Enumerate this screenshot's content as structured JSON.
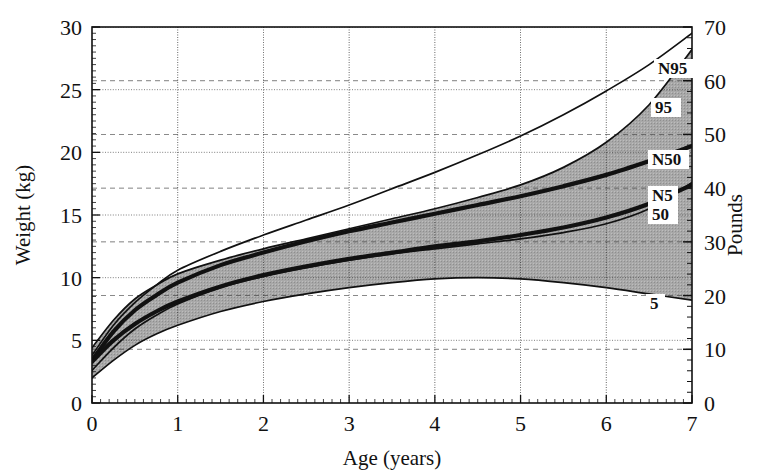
{
  "chart_data": {
    "type": "line",
    "title": "",
    "xlabel": "Age (years)",
    "ylabel": "Weight (kg)",
    "y2label": "Pounds",
    "xlim": [
      0,
      7
    ],
    "ylim": [
      0,
      30
    ],
    "y2lim": [
      0,
      70
    ],
    "xticks": [
      "0",
      "1",
      "2",
      "3",
      "4",
      "5",
      "6",
      "7"
    ],
    "yticks": [
      "0",
      "5",
      "10",
      "15",
      "20",
      "25",
      "30"
    ],
    "y2ticks": [
      "0",
      "10",
      "20",
      "30",
      "40",
      "50",
      "60",
      "70"
    ],
    "grid": true,
    "legend_position": "inline-right-end-labels",
    "shaded_band": {
      "label": "reference band between 5th and 95th percentile",
      "fill": "#a8a8a8"
    },
    "x": [
      0,
      0.25,
      0.5,
      0.75,
      1,
      1.5,
      2,
      2.5,
      3,
      3.5,
      4,
      4.5,
      5,
      5.5,
      6,
      6.5,
      7
    ],
    "series": [
      {
        "name": "N95",
        "label": "N95",
        "style": "thin",
        "values": [
          3.8,
          6.2,
          8.0,
          9.4,
          10.6,
          12.1,
          13.4,
          14.6,
          15.8,
          17.1,
          18.4,
          19.8,
          21.3,
          23.0,
          24.9,
          27.0,
          29.5
        ]
      },
      {
        "name": "95",
        "label": "95",
        "style": "thin",
        "values": [
          4.4,
          6.6,
          8.3,
          9.4,
          10.3,
          11.4,
          12.3,
          13.1,
          13.9,
          14.7,
          15.5,
          16.4,
          17.4,
          18.8,
          20.8,
          23.8,
          28.2
        ]
      },
      {
        "name": "N50",
        "label": "N50",
        "style": "bold",
        "values": [
          3.4,
          5.7,
          7.4,
          8.6,
          9.6,
          11.0,
          12.0,
          12.9,
          13.7,
          14.4,
          15.1,
          15.8,
          16.5,
          17.3,
          18.2,
          19.3,
          20.5
        ]
      },
      {
        "name": "N5",
        "label": "N5",
        "style": "thin",
        "values": [
          2.6,
          4.4,
          5.9,
          7.0,
          7.9,
          9.2,
          10.1,
          10.8,
          11.4,
          11.9,
          12.3,
          12.7,
          13.1,
          13.6,
          14.3,
          15.5,
          17.6
        ]
      },
      {
        "name": "50",
        "label": "50",
        "style": "bold",
        "values": [
          3.3,
          5.0,
          6.3,
          7.3,
          8.1,
          9.3,
          10.2,
          10.9,
          11.5,
          12.0,
          12.5,
          12.9,
          13.4,
          14.0,
          14.8,
          15.9,
          17.4
        ]
      },
      {
        "name": "5",
        "label": "5",
        "style": "thin",
        "values": [
          2.0,
          3.4,
          4.6,
          5.5,
          6.2,
          7.3,
          8.1,
          8.7,
          9.2,
          9.6,
          9.9,
          10.0,
          9.9,
          9.6,
          9.2,
          8.7,
          8.2
        ]
      }
    ]
  }
}
